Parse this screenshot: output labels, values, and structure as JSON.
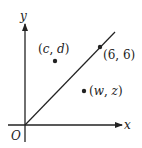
{
  "diagram": {
    "axes": {
      "x_label": "x",
      "y_label": "y",
      "origin_label": "O"
    },
    "line": {
      "description": "line y = x through origin and (6, 6)"
    },
    "points": [
      {
        "label": "(6, 6)",
        "open": "(",
        "a": "6",
        "sep": ", ",
        "b": "6",
        "close": ")"
      },
      {
        "label": "(c, d)",
        "open": "(",
        "a": "c",
        "sep": ", ",
        "b": "d",
        "close": ")"
      },
      {
        "label": "(w, z)",
        "open": "(",
        "a": "w",
        "sep": ", ",
        "b": "z",
        "close": ")"
      }
    ],
    "colors": {
      "ink": "#222222",
      "background": "#ffffff"
    }
  }
}
